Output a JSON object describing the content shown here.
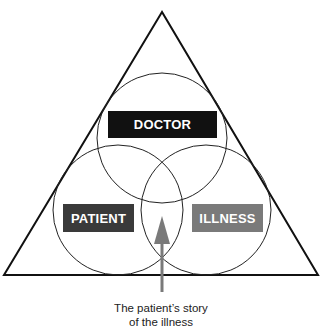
{
  "diagram": {
    "labels": {
      "doctor": "DOCTOR",
      "patient": "PATIENT",
      "illness": "ILLNESS"
    },
    "caption": {
      "line1": "The patient’s story",
      "line2": "of the illness"
    },
    "colors": {
      "doctor": "#111111",
      "patient": "#3a3a3a",
      "illness": "#7a7a7a",
      "arrow": "#7a7a7a",
      "lines": "#111111"
    }
  }
}
